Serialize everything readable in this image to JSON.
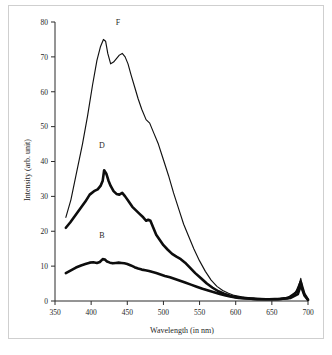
{
  "chart_data": {
    "type": "line",
    "title": "",
    "subtitle": "",
    "xlabel": "Wavelength (in nm)",
    "ylabel": "Intensity (arb. unit)",
    "xlim": [
      350,
      700
    ],
    "ylim": [
      0,
      80
    ],
    "xticks": [
      350,
      400,
      450,
      500,
      550,
      600,
      650,
      700
    ],
    "yticks": [
      0,
      10,
      20,
      30,
      40,
      50,
      60,
      70,
      80
    ],
    "grid": false,
    "legend_position": "inline-annotations",
    "annotations": [
      {
        "text": "F",
        "x": 437,
        "y": 79
      },
      {
        "text": "D",
        "x": 415,
        "y": 44
      },
      {
        "text": "B",
        "x": 415,
        "y": 18
      }
    ],
    "series": [
      {
        "name": "F",
        "label": "F",
        "style": "thin",
        "color": "#111111",
        "x": [
          365,
          372,
          380,
          388,
          395,
          402,
          408,
          413,
          417,
          420,
          423,
          427,
          431,
          435,
          439,
          443,
          447,
          451,
          455,
          460,
          465,
          470,
          476,
          481,
          487,
          493,
          500,
          507,
          514,
          521,
          528,
          535,
          542,
          550,
          558,
          566,
          574,
          582,
          590,
          598,
          608,
          620,
          635,
          650,
          665,
          678,
          686,
          690,
          694,
          700
        ],
        "y": [
          24,
          29,
          37,
          45,
          53,
          62,
          69,
          73,
          75,
          74.5,
          71,
          68,
          68.5,
          69.5,
          70.5,
          71,
          70,
          68,
          65,
          61.5,
          58,
          55,
          52,
          51,
          48,
          45,
          40.5,
          36,
          31,
          26.5,
          22,
          18.5,
          15,
          11.5,
          8.5,
          6,
          4.2,
          3,
          2.2,
          1.6,
          1.2,
          0.9,
          0.7,
          0.6,
          0.8,
          1.4,
          3.5,
          6.5,
          2.2,
          0.5
        ]
      },
      {
        "name": "D",
        "label": "D",
        "style": "thick",
        "color": "#0d0d0d",
        "x": [
          365,
          371,
          378,
          385,
          392,
          398,
          404,
          409,
          413,
          416,
          418,
          421,
          424,
          427,
          431,
          435,
          439,
          443,
          447,
          452,
          457,
          462,
          467,
          472,
          476,
          479,
          482,
          486,
          490,
          495,
          500,
          506,
          512,
          518,
          524,
          530,
          537,
          544,
          552,
          560,
          568,
          576,
          584,
          592,
          600,
          612,
          626,
          642,
          658,
          672,
          684,
          690,
          695,
          700
        ],
        "y": [
          21,
          22.5,
          24.5,
          26.5,
          28.5,
          30.5,
          31.5,
          32,
          33,
          34.5,
          37.5,
          36.5,
          34.5,
          33,
          31.5,
          30.7,
          30.5,
          31,
          30,
          28.5,
          27,
          26,
          25,
          24,
          23,
          23.3,
          23,
          21,
          19,
          17.5,
          16,
          14.7,
          13.5,
          12.7,
          12,
          11,
          9.5,
          8,
          6.5,
          5,
          3.8,
          2.8,
          2.1,
          1.5,
          1.1,
          0.8,
          0.6,
          0.5,
          0.5,
          0.8,
          2.5,
          5.5,
          2,
          0.4
        ]
      },
      {
        "name": "B",
        "label": "B",
        "style": "thick",
        "color": "#0d0d0d",
        "x": [
          365,
          372,
          379,
          386,
          392,
          398,
          403,
          408,
          412,
          416,
          419,
          422,
          426,
          430,
          434,
          438,
          442,
          446,
          450,
          455,
          460,
          465,
          470,
          475,
          480,
          485,
          490,
          496,
          502,
          509,
          516,
          523,
          530,
          538,
          546,
          554,
          562,
          570,
          578,
          586,
          594,
          604,
          616,
          630,
          646,
          662,
          676,
          686,
          690,
          695,
          700
        ],
        "y": [
          8,
          8.8,
          9.6,
          10.2,
          10.6,
          11,
          11.1,
          10.9,
          11.2,
          12,
          11.9,
          11.3,
          11,
          10.8,
          10.9,
          11,
          10.9,
          10.8,
          10.6,
          10.2,
          9.7,
          9.3,
          9,
          8.8,
          8.6,
          8.3,
          8,
          7.6,
          7.2,
          6.8,
          6.3,
          5.8,
          5.3,
          4.7,
          4.1,
          3.5,
          3,
          2.5,
          2,
          1.6,
          1.2,
          0.9,
          0.7,
          0.5,
          0.5,
          0.6,
          0.9,
          2,
          4.5,
          1.6,
          0.3
        ]
      }
    ]
  }
}
